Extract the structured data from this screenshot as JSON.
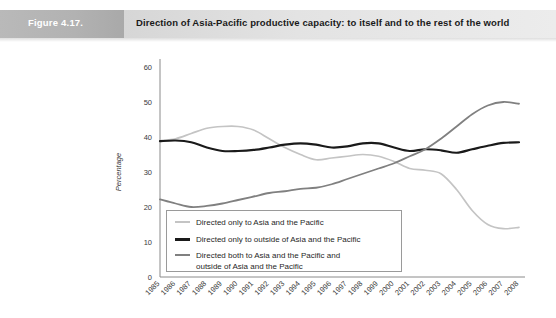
{
  "header": {
    "figure_number": "Figure 4.17.",
    "title": "Direction of Asia-Pacific productive capacity: to itself and to the rest of the world"
  },
  "chart_data": {
    "type": "line",
    "title": "Direction of Asia-Pacific productive capacity: to itself and to the rest of the world",
    "xlabel": "",
    "ylabel": "Percentage",
    "ylim": [
      0,
      60
    ],
    "yticks": [
      0,
      10,
      20,
      30,
      40,
      50,
      60
    ],
    "grid": false,
    "legend_position": "inside-bottom-left",
    "categories": [
      "1985",
      "1986",
      "1987",
      "1988",
      "1989",
      "1990",
      "1991",
      "1992",
      "1993",
      "1994",
      "1995",
      "1996",
      "1997",
      "1998",
      "1999",
      "2000",
      "2001",
      "2002",
      "2003",
      "2004",
      "2005",
      "2006",
      "2007",
      "2008"
    ],
    "series": [
      {
        "name": "Directed only to Asia and the Pacific",
        "color": "#c4c4c4",
        "width": 1.7,
        "values": [
          39.0,
          39.5,
          41.0,
          42.5,
          43.0,
          43.0,
          42.0,
          39.5,
          37.0,
          35.0,
          33.5,
          34.0,
          34.5,
          35.0,
          34.5,
          33.0,
          31.0,
          30.5,
          29.5,
          25.0,
          19.0,
          15.0,
          13.8,
          14.2
        ]
      },
      {
        "name": "Directed only to outside of Asia and the Pacific",
        "color": "#1a1a1a",
        "width": 2.2,
        "values": [
          38.8,
          39.0,
          38.5,
          37.0,
          36.0,
          36.0,
          36.3,
          37.0,
          37.8,
          38.2,
          37.8,
          37.0,
          37.3,
          38.2,
          38.2,
          37.0,
          36.0,
          36.5,
          36.2,
          35.5,
          36.5,
          37.5,
          38.3,
          38.5
        ]
      },
      {
        "name": "Directed both to Asia and the Pacific and outside of Asia and the Pacific",
        "color": "#808080",
        "width": 1.8,
        "values": [
          22.2,
          21.0,
          20.0,
          20.3,
          21.0,
          22.0,
          23.0,
          24.0,
          24.5,
          25.2,
          25.5,
          26.5,
          28.0,
          29.5,
          31.0,
          32.5,
          34.5,
          36.5,
          39.5,
          43.0,
          46.5,
          49.0,
          50.0,
          49.5
        ]
      }
    ]
  },
  "legend": {
    "items": [
      {
        "label": "Directed only to Asia and the Pacific",
        "color": "#c4c4c4",
        "thickness": "1.7px"
      },
      {
        "label": "Directed only to outside of Asia and the Pacific",
        "color": "#1a1a1a",
        "thickness": "2.6px"
      },
      {
        "label": "Directed both to Asia and the Pacific and\noutside of Asia and the Pacific",
        "color": "#808080",
        "thickness": "1.8px"
      }
    ]
  }
}
